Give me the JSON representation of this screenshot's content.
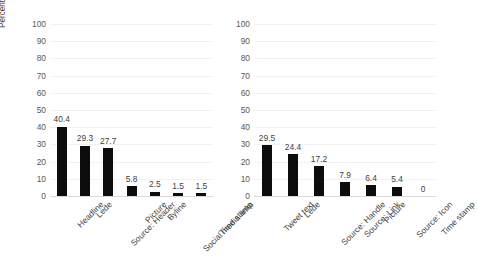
{
  "chart_data": [
    {
      "id": "news-article-elements",
      "type": "bar",
      "title": "",
      "xlabel": "",
      "ylabel": "Percent who select each element as important",
      "ylim": [
        0,
        100
      ],
      "yticks": [
        0,
        10,
        20,
        30,
        40,
        50,
        60,
        70,
        80,
        90,
        100
      ],
      "ytick_labels": [
        "0",
        "10",
        "20",
        "30",
        "40",
        "50",
        "60",
        "70",
        "80",
        "90",
        "100"
      ],
      "grid": true,
      "legend": "none",
      "bar_color": "#0d0d0d",
      "grid_color": "#f2f2f2",
      "categories": [
        "Headline",
        "Lede",
        "Source: Header",
        "Picture",
        "Byline",
        "Social media links",
        "Time stamp"
      ],
      "values": [
        40.4,
        29.3,
        27.7,
        5.8,
        2.5,
        1.5,
        1.5
      ],
      "data_labels": [
        "40.4",
        "29.3",
        "27.7",
        "5.8",
        "2.5",
        "1.5",
        "1.5"
      ]
    },
    {
      "id": "tweet-elements",
      "type": "bar",
      "title": "",
      "xlabel": "",
      "ylabel": "",
      "ylim": [
        0,
        100
      ],
      "yticks": [
        0,
        10,
        20,
        30,
        40,
        50,
        60,
        70,
        80,
        90,
        100
      ],
      "ytick_labels": [
        "0",
        "10",
        "20",
        "30",
        "40",
        "50",
        "60",
        "70",
        "80",
        "90",
        "100"
      ],
      "grid": true,
      "legend": "none",
      "bar_color": "#0d0d0d",
      "grid_color": "#f2f2f2",
      "categories": [
        "Tweet text",
        "Lede",
        "Source: Handle",
        "Source: Link",
        "Picture",
        "Source: Icon",
        "Time stamp"
      ],
      "values": [
        29.5,
        24.4,
        17.2,
        7.9,
        6.4,
        5.4,
        0
      ],
      "data_labels": [
        "29.5",
        "24.4",
        "17.2",
        "7.9",
        "6.4",
        "5.4",
        "0"
      ]
    }
  ]
}
